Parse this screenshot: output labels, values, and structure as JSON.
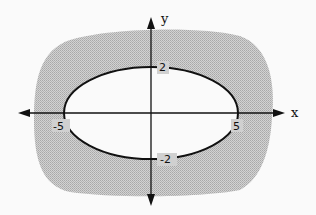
{
  "diagram": {
    "type": "ellipse-region-graph",
    "axes": {
      "x_label": "x",
      "y_label": "y"
    },
    "ellipse": {
      "x_intercepts": [
        "-5",
        "5"
      ],
      "y_intercepts": [
        "2",
        "-2"
      ]
    },
    "shading": {
      "region": "outside ellipse",
      "color": "#c4c4c4"
    },
    "labels": {
      "x_pos": "5",
      "x_neg": "-5",
      "y_pos": "2",
      "y_neg": "-2"
    }
  }
}
